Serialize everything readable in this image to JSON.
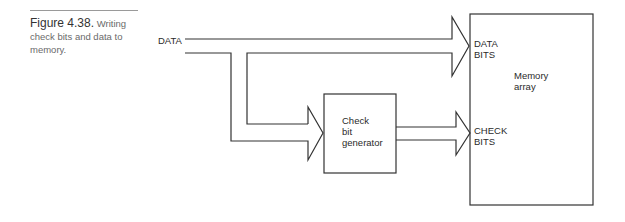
{
  "caption": {
    "figure_label": "Figure 4.38.",
    "text": "Writing check bits and data to memory."
  },
  "diagram": {
    "input_label": "DATA",
    "blocks": [
      {
        "id": "check-bit-generator",
        "lines": [
          "Check",
          "bit",
          "generator"
        ]
      },
      {
        "id": "memory-array",
        "lines": [
          "Memory",
          "array"
        ]
      }
    ],
    "ports": {
      "data_bits": [
        "DATA",
        "BITS"
      ],
      "check_bits": [
        "CHECK",
        "BITS"
      ]
    },
    "colors": {
      "line": "#333333",
      "background": "#ffffff"
    }
  }
}
